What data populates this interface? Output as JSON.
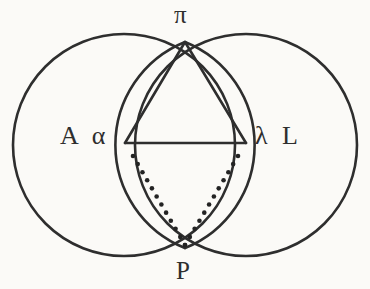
{
  "figure": {
    "background_color": "#fbfaf7",
    "ink_color": "#2e2e2e",
    "stroke_width": 2.6,
    "dot_color": "#232323",
    "dot_radius": 2.3,
    "width": 370,
    "height": 289
  },
  "labels": {
    "apex": "π",
    "left": "A α",
    "right": "λ L",
    "bottom": "P"
  },
  "geometry": {
    "left_circle": {
      "cx": 124,
      "cy": 145,
      "r": 111
    },
    "right_circle": {
      "cx": 246,
      "cy": 145,
      "r": 111
    },
    "top_intersection": {
      "x": 185,
      "y": 42
    },
    "bottom_intersection": {
      "x": 185,
      "y": 248
    },
    "chord_left": {
      "x": 125,
      "y": 143
    },
    "chord_right": {
      "x": 246,
      "y": 143
    },
    "triangle_vertices": "185,42 125,143 246,143",
    "chord_path": "M 125 143 L 246 143",
    "triangle_left_side": "M 185 42 L 125 143",
    "triangle_right_side": "M 185 42 L 246 143",
    "dotted_left_start": {
      "x": 133,
      "y": 156
    },
    "dotted_right_start": {
      "x": 238,
      "y": 156
    },
    "dotted_converge": {
      "x": 185,
      "y": 245
    },
    "dotted_left_count": 12,
    "dotted_right_count": 12
  },
  "chart_data": {
    "type": "diagram",
    "elements": [
      {
        "name": "left-circle",
        "kind": "circle",
        "cx": 124,
        "cy": 145,
        "r": 111,
        "style": "solid"
      },
      {
        "name": "right-circle",
        "kind": "circle",
        "cx": 246,
        "cy": 145,
        "r": 111,
        "style": "solid"
      },
      {
        "name": "lens-left-arc",
        "kind": "arc",
        "from": "185,42",
        "to": "185,248",
        "style": "solid"
      },
      {
        "name": "lens-right-arc",
        "kind": "arc",
        "from": "185,42",
        "to": "185,248",
        "style": "solid"
      },
      {
        "name": "chord",
        "kind": "line",
        "from": "125,143",
        "to": "246,143",
        "style": "solid"
      },
      {
        "name": "triangle-left-side",
        "kind": "line",
        "from": "185,42",
        "to": "125,143",
        "style": "solid"
      },
      {
        "name": "triangle-right-side",
        "kind": "line",
        "from": "185,42",
        "to": "246,143",
        "style": "solid"
      },
      {
        "name": "dotted-left",
        "kind": "dotted-line",
        "from": "133,156",
        "to": "185,245",
        "style": "dotted"
      },
      {
        "name": "dotted-right",
        "kind": "dotted-line",
        "from": "238,156",
        "to": "185,245",
        "style": "dotted"
      }
    ],
    "point_labels": [
      {
        "name": "apex-label",
        "text": "π",
        "x": 185,
        "y": 18
      },
      {
        "name": "left-label",
        "text": "A α",
        "x": 85,
        "y": 140
      },
      {
        "name": "right-label",
        "text": "λ L",
        "x": 281,
        "y": 140
      },
      {
        "name": "bottom-label",
        "text": "P",
        "x": 185,
        "y": 272
      }
    ]
  }
}
